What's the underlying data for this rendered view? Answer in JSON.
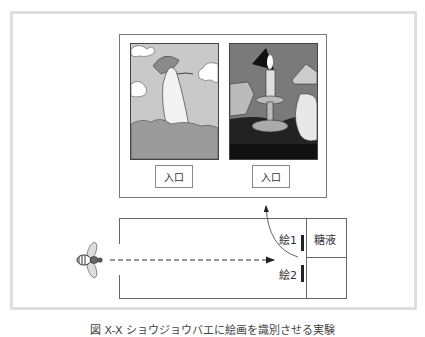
{
  "figure": {
    "paintings": [
      {
        "name": "painting-woman-with-parasol",
        "entrance_label": "入口"
      },
      {
        "name": "painting-candle-still-life",
        "entrance_label": "入口"
      }
    ],
    "maze": {
      "picture1_label": "絵1",
      "picture2_label": "絵2",
      "reward_label": "糖液"
    },
    "caption": "図 X-X ショウジョウバエに絵画を識別させる実験"
  },
  "colors": {
    "frame": "#dedede",
    "line": "#666666",
    "bar": "#222222"
  }
}
